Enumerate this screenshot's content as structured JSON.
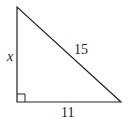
{
  "diagram": {
    "type": "right-triangle",
    "labels": {
      "vertical_leg": "x",
      "hypotenuse": "15",
      "horizontal_leg": "11"
    },
    "right_angle_marker": true,
    "colors": {
      "stroke": "#222222",
      "background": "#ffffff"
    }
  }
}
